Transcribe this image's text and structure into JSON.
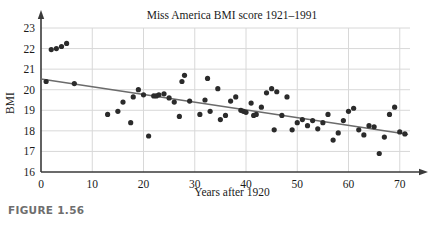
{
  "figure": {
    "caption": "FIGURE 1.56"
  },
  "chart_data": {
    "type": "scatter",
    "title": "Miss America BMI score 1921–1991",
    "xlabel": "Years after 1920",
    "ylabel": "BMI",
    "xlim": [
      0,
      72
    ],
    "ylim": [
      16,
      23
    ],
    "xticks": [
      0,
      10,
      20,
      30,
      40,
      50,
      60,
      70
    ],
    "yticks": [
      16,
      17,
      18,
      19,
      20,
      21,
      22,
      23
    ],
    "grid": true,
    "grid_color": "#d8d8d8",
    "point_color": "#2b2b2b",
    "point_radius": 2.6,
    "trendline": {
      "label": "least-squares regression line",
      "color": "#6b6b6b",
      "x0": 0,
      "y0": 20.52,
      "x1": 71.5,
      "y1": 17.83
    },
    "x": [
      1,
      2,
      3,
      4,
      5,
      6.5,
      13,
      15,
      16,
      17.5,
      18,
      19,
      20,
      21,
      22,
      22.5,
      23,
      24,
      25,
      26,
      27,
      27.5,
      28,
      29,
      31,
      32,
      32.5,
      33,
      34.5,
      35,
      36,
      37,
      38,
      39,
      39.5,
      40,
      41,
      41.5,
      42,
      43,
      44,
      45,
      45.5,
      46,
      47,
      48,
      49,
      50,
      51,
      52,
      53,
      54,
      55,
      56,
      57,
      58,
      59,
      60,
      61,
      62,
      63,
      64,
      65,
      66,
      67,
      68,
      69,
      70,
      71
    ],
    "y": [
      20.4,
      21.95,
      22.0,
      22.1,
      22.25,
      20.3,
      18.8,
      18.95,
      19.4,
      18.4,
      19.65,
      20.0,
      19.75,
      17.75,
      19.7,
      19.7,
      19.75,
      19.8,
      19.6,
      19.4,
      18.7,
      20.4,
      20.7,
      19.45,
      18.8,
      19.5,
      20.55,
      18.95,
      20.05,
      18.55,
      18.75,
      19.45,
      19.65,
      19.0,
      18.95,
      18.9,
      19.35,
      18.75,
      18.8,
      19.15,
      19.85,
      20.05,
      18.05,
      19.9,
      18.75,
      19.65,
      18.05,
      18.4,
      18.55,
      18.25,
      18.5,
      18.1,
      18.4,
      18.8,
      17.55,
      17.9,
      18.5,
      18.95,
      19.1,
      18.05,
      17.8,
      18.25,
      18.2,
      16.9,
      17.7,
      18.8,
      19.15,
      17.95,
      17.85
    ],
    "series": [
      {
        "name": "Miss America BMI",
        "points": [
          [
            1,
            20.4
          ],
          [
            2,
            21.95
          ],
          [
            3,
            22.0
          ],
          [
            4,
            22.1
          ],
          [
            5,
            22.25
          ],
          [
            6.5,
            20.3
          ],
          [
            13,
            18.8
          ],
          [
            15,
            18.95
          ],
          [
            16,
            19.4
          ],
          [
            17.5,
            18.4
          ],
          [
            18,
            19.65
          ],
          [
            19,
            20.0
          ],
          [
            20,
            19.75
          ],
          [
            21,
            17.75
          ],
          [
            22,
            19.7
          ],
          [
            22.5,
            19.7
          ],
          [
            23,
            19.75
          ],
          [
            24,
            19.8
          ],
          [
            25,
            19.6
          ],
          [
            26,
            19.4
          ],
          [
            27,
            18.7
          ],
          [
            27.5,
            20.4
          ],
          [
            28,
            20.7
          ],
          [
            29,
            19.45
          ],
          [
            31,
            18.8
          ],
          [
            32,
            19.5
          ],
          [
            32.5,
            20.55
          ],
          [
            33,
            18.95
          ],
          [
            34.5,
            20.05
          ],
          [
            35,
            18.55
          ],
          [
            36,
            18.75
          ],
          [
            37,
            19.45
          ],
          [
            38,
            19.65
          ],
          [
            39,
            19.0
          ],
          [
            39.5,
            18.95
          ],
          [
            40,
            18.9
          ],
          [
            41,
            19.35
          ],
          [
            41.5,
            18.75
          ],
          [
            42,
            18.8
          ],
          [
            43,
            19.15
          ],
          [
            44,
            19.85
          ],
          [
            45,
            20.05
          ],
          [
            45.5,
            18.05
          ],
          [
            46,
            19.9
          ],
          [
            47,
            18.75
          ],
          [
            48,
            19.65
          ],
          [
            49,
            18.05
          ],
          [
            50,
            18.4
          ],
          [
            51,
            18.55
          ],
          [
            52,
            18.25
          ],
          [
            53,
            18.5
          ],
          [
            54,
            18.1
          ],
          [
            55,
            18.4
          ],
          [
            56,
            18.8
          ],
          [
            57,
            17.55
          ],
          [
            58,
            17.9
          ],
          [
            59,
            18.5
          ],
          [
            60,
            18.95
          ],
          [
            61,
            19.1
          ],
          [
            62,
            18.05
          ],
          [
            63,
            17.8
          ],
          [
            64,
            18.25
          ],
          [
            65,
            18.2
          ],
          [
            66,
            16.9
          ],
          [
            67,
            17.7
          ],
          [
            68,
            18.8
          ],
          [
            69,
            19.15
          ],
          [
            70,
            17.95
          ],
          [
            71,
            17.85
          ]
        ]
      }
    ]
  }
}
